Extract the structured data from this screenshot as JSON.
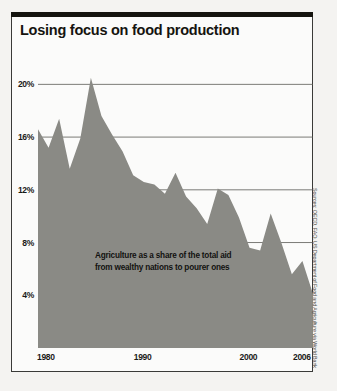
{
  "chart_title": "Losing focus on food production",
  "annotation": {
    "line1": "Agriculture as a share of the total aid",
    "line2": "from wealthy nations to pourer ones"
  },
  "source": "Sources: OECD, FAO, US Department of Food and Agriculture via World Bank",
  "colors": {
    "area_fill": "#8a8a85",
    "gridline": "#5a5a56",
    "title": "#15140f",
    "rule": "#15140f",
    "frame": "#3a3a38"
  },
  "chart_data": {
    "type": "area",
    "title": "Losing focus on food production",
    "subtitle": "Agriculture as a share of the total aid from wealthy nations to pourer ones",
    "xlabel": "",
    "ylabel": "",
    "xlim": [
      1980,
      2006
    ],
    "ylim": [
      0,
      22
    ],
    "grid": true,
    "legend": "none",
    "ytick_labels": [
      "20%",
      "16%",
      "12%",
      "8%",
      "4%"
    ],
    "ytick_values": [
      20,
      16,
      12,
      8,
      4
    ],
    "xtick_labels": [
      "1980",
      "1990",
      "2000",
      "2006"
    ],
    "xtick_values": [
      1980,
      1990,
      2000,
      2006
    ],
    "x": [
      1980,
      1981,
      1982,
      1983,
      1984,
      1985,
      1986,
      1987,
      1988,
      1989,
      1990,
      1991,
      1992,
      1993,
      1994,
      1995,
      1996,
      1997,
      1998,
      1999,
      2000,
      2001,
      2002,
      2003,
      2004,
      2005,
      2006
    ],
    "series": [
      {
        "name": "Agriculture share of total aid",
        "units": "percent",
        "values": [
          16.6,
          15.2,
          17.4,
          13.6,
          15.9,
          20.5,
          17.6,
          16.2,
          14.9,
          13.1,
          12.6,
          12.4,
          11.7,
          13.3,
          11.5,
          10.6,
          9.4,
          12.1,
          11.6,
          9.9,
          7.6,
          7.4,
          10.2,
          8.0,
          5.6,
          6.6,
          4.1
        ]
      }
    ]
  }
}
